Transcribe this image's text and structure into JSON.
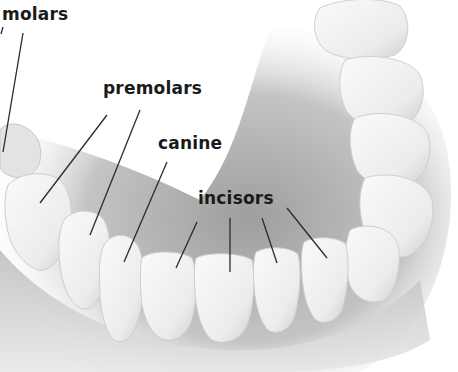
{
  "diagram": {
    "labels": {
      "molars": "molars",
      "premolars": "premolars",
      "canine": "canine",
      "incisors": "incisors"
    },
    "label_positions": {
      "molars": [
        2,
        6
      ],
      "premolars": [
        103,
        80
      ],
      "canine": [
        158,
        135
      ],
      "incisors": [
        198,
        190
      ]
    },
    "leader_lines": {
      "molars": [
        [
          [
            23,
            33
          ],
          [
            3,
            152
          ]
        ],
        [
          [
            3,
            27
          ],
          [
            1,
            34
          ]
        ]
      ],
      "premolars": [
        [
          [
            107,
            115
          ],
          [
            40,
            203
          ]
        ],
        [
          [
            140,
            110
          ],
          [
            90,
            235
          ]
        ]
      ],
      "canine": [
        [
          [
            167,
            162
          ],
          [
            124,
            262
          ]
        ]
      ],
      "incisors": [
        [
          [
            197,
            222
          ],
          [
            176,
            268
          ]
        ],
        [
          [
            230,
            218
          ],
          [
            230,
            272
          ]
        ],
        [
          [
            262,
            218
          ],
          [
            277,
            263
          ]
        ],
        [
          [
            287,
            208
          ],
          [
            327,
            258
          ]
        ]
      ]
    },
    "colors": {
      "background": "#ffffff",
      "label_text": "#1a1a1a",
      "leader_line": "#2a2a2a",
      "tooth_fill": "#f2f2f2",
      "tooth_shadow": "#c9c9c9",
      "gum": "#bdbdbd"
    }
  }
}
